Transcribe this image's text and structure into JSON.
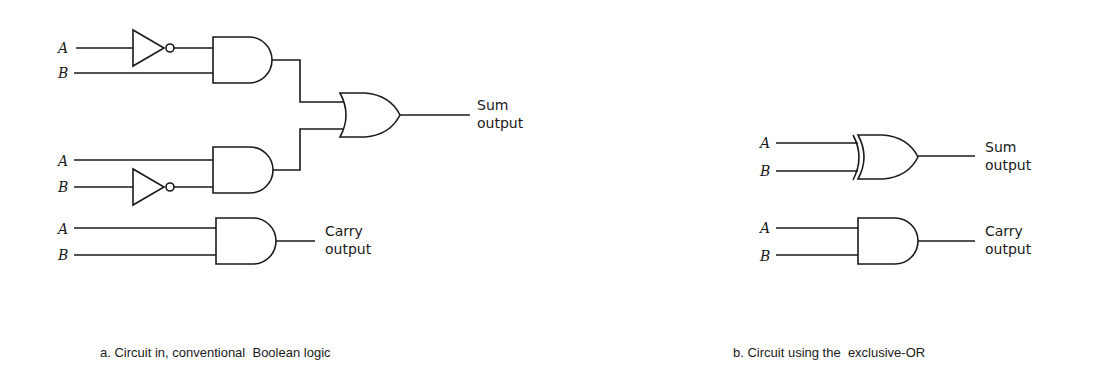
{
  "diagram": {
    "type": "logic-circuit",
    "panels": [
      {
        "id": "a",
        "caption": "a. Circuit in, conventional  Boolean logic",
        "inputs": [
          "A",
          "B",
          "A",
          "B",
          "A",
          "B"
        ],
        "gates": [
          {
            "id": "not1",
            "type": "NOT",
            "input": "A"
          },
          {
            "id": "and1",
            "type": "AND",
            "inputs": [
              "NOT A",
              "B"
            ]
          },
          {
            "id": "not2",
            "type": "NOT",
            "input": "B"
          },
          {
            "id": "and2",
            "type": "AND",
            "inputs": [
              "A",
              "NOT B"
            ]
          },
          {
            "id": "or1",
            "type": "OR",
            "inputs": [
              "and1",
              "and2"
            ]
          },
          {
            "id": "and3",
            "type": "AND",
            "inputs": [
              "A",
              "B"
            ]
          }
        ],
        "outputs": {
          "sum_line1": "Sum",
          "sum_line2": "output",
          "carry_line1": "Carry",
          "carry_line2": "output"
        },
        "labels": {
          "a1": "A",
          "b1": "B",
          "a2": "A",
          "b2": "B",
          "a3": "A",
          "b3": "B"
        }
      },
      {
        "id": "b",
        "caption": "b. Circuit using the  exclusive-OR",
        "gates": [
          {
            "id": "xor1",
            "type": "XOR",
            "inputs": [
              "A",
              "B"
            ]
          },
          {
            "id": "and4",
            "type": "AND",
            "inputs": [
              "A",
              "B"
            ]
          }
        ],
        "outputs": {
          "sum_line1": "Sum",
          "sum_line2": "output",
          "carry_line1": "Carry",
          "carry_line2": "output"
        },
        "labels": {
          "a1": "A",
          "b1": "B",
          "a2": "A",
          "b2": "B"
        }
      }
    ]
  }
}
